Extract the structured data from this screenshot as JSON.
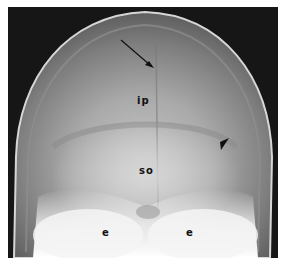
{
  "figure": {
    "type": "radiograph",
    "labels": [
      {
        "id": "ip",
        "text": "ip"
      },
      {
        "id": "so",
        "text": "so"
      },
      {
        "id": "e-left",
        "text": "e"
      },
      {
        "id": "e-right",
        "text": "e"
      }
    ],
    "markers": [
      {
        "id": "arrow",
        "kind": "arrow"
      },
      {
        "id": "arrowhead",
        "kind": "arrowhead"
      }
    ]
  }
}
